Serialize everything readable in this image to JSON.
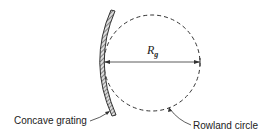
{
  "diagram": {
    "labels": {
      "grating": "Concave grating",
      "circle": "Rowland circle",
      "radius_symbol": "R",
      "radius_subscript": "g"
    },
    "colors": {
      "stroke": "#333333",
      "background": "#ffffff"
    }
  }
}
